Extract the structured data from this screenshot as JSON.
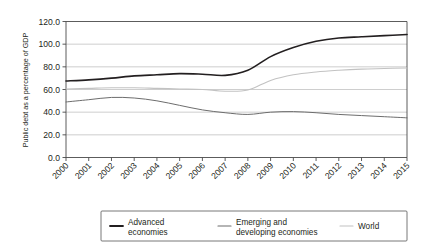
{
  "chart_data": {
    "type": "line",
    "title": "",
    "xlabel": "",
    "ylabel": "Public debt as a percentage of GDP",
    "x": [
      2000,
      2001,
      2002,
      2003,
      2004,
      2005,
      2006,
      2007,
      2008,
      2009,
      2010,
      2011,
      2012,
      2013,
      2014,
      2015
    ],
    "xtick_labels": [
      "2000",
      "2001",
      "2002",
      "2003",
      "2004",
      "2005",
      "2006",
      "2007",
      "2008",
      "2009",
      "2010",
      "2011",
      "2012",
      "2013",
      "2014",
      "2015"
    ],
    "ytick_labels": [
      "0.0",
      "20.0",
      "40.0",
      "60.0",
      "80.0",
      "100.0",
      "120.0"
    ],
    "yticks": [
      0,
      20,
      40,
      60,
      80,
      100,
      120
    ],
    "ylim": [
      0,
      120
    ],
    "xlim": [
      2000,
      2015
    ],
    "grid": "horizontal",
    "legend_position": "bottom",
    "series": [
      {
        "name": "Advanced economies",
        "color": "#231f20",
        "width": 1.6,
        "values": [
          67.5,
          68.5,
          70.0,
          72.0,
          73.0,
          74.0,
          73.5,
          72.5,
          77.0,
          89.0,
          97.0,
          102.5,
          105.5,
          106.5,
          107.5,
          108.5
        ]
      },
      {
        "name": "Emerging and developing economies",
        "color": "#6d6d6d",
        "width": 1.0,
        "values": [
          49.0,
          51.0,
          53.0,
          52.5,
          50.0,
          46.0,
          42.0,
          39.5,
          38.0,
          40.0,
          40.5,
          39.5,
          38.0,
          37.0,
          36.0,
          35.0
        ]
      },
      {
        "name": "World",
        "color": "#c2c2c2",
        "width": 1.1,
        "values": [
          60.5,
          61.0,
          61.5,
          61.5,
          61.0,
          60.5,
          60.0,
          58.5,
          59.5,
          68.0,
          73.0,
          75.5,
          77.0,
          78.0,
          78.5,
          79.0
        ]
      }
    ]
  },
  "legend": {
    "items": [
      {
        "label_line1": "Advanced",
        "label_line2": "economies",
        "color": "#231f20",
        "width": 1.8
      },
      {
        "label_line1": "Emerging and",
        "label_line2": "developing economies",
        "color": "#6d6d6d",
        "width": 1.2
      },
      {
        "label_line1": "World",
        "label_line2": "",
        "color": "#c2c2c2",
        "width": 1.2
      }
    ]
  }
}
